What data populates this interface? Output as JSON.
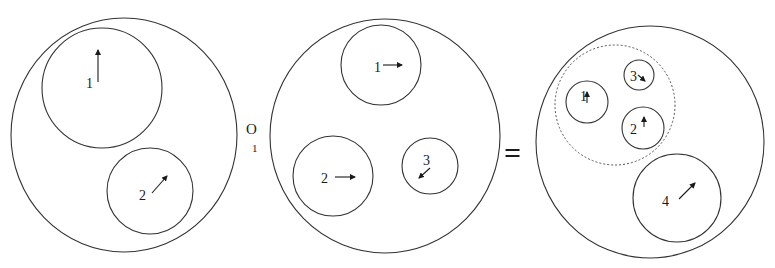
{
  "diagram": {
    "panels": [
      {
        "id": "left",
        "outer": {
          "cx": 124,
          "cy": 135,
          "rx": 113,
          "ry": 117
        },
        "bubbles": [
          {
            "label": "1",
            "cx": 102,
            "cy": 88,
            "r": 60,
            "lx": 86,
            "ly": 88,
            "arrow": [
              98,
              82,
              98,
              50
            ]
          },
          {
            "label": "2",
            "cx": 150,
            "cy": 191,
            "r": 43,
            "lx": 139,
            "ly": 200,
            "arrow": [
              152,
              193,
              167,
              176
            ]
          }
        ]
      },
      {
        "id": "middle",
        "outer": {
          "cx": 385,
          "cy": 136,
          "rx": 115,
          "ry": 117
        },
        "bubbles": [
          {
            "label": "1",
            "cx": 381,
            "cy": 65,
            "r": 40,
            "lx": 374,
            "ly": 72,
            "arrow": [
              383,
              65,
              402,
              65
            ]
          },
          {
            "label": "2",
            "cx": 333,
            "cy": 176,
            "r": 40,
            "lx": 321,
            "ly": 183,
            "arrow": [
              335,
              177,
              355,
              177
            ]
          },
          {
            "label": "3",
            "cx": 430,
            "cy": 166,
            "r": 28,
            "lx": 423,
            "ly": 165,
            "arrow": [
              430,
              168,
              419,
              178
            ]
          }
        ]
      },
      {
        "id": "right",
        "outer": {
          "cx": 650,
          "cy": 142,
          "rx": 114,
          "ry": 116
        },
        "group": {
          "cx": 615,
          "cy": 105,
          "r": 60,
          "style": "dotted"
        },
        "bubbles": [
          {
            "label": "1",
            "cx": 587,
            "cy": 102,
            "r": 21,
            "lx": 580,
            "ly": 101,
            "arrow": [
              587,
              103,
              587,
              92
            ]
          },
          {
            "label": "3",
            "cx": 639,
            "cy": 75,
            "r": 15,
            "lx": 630,
            "ly": 81,
            "arrow": [
              638,
              75,
              645,
              81
            ]
          },
          {
            "label": "2",
            "cx": 643,
            "cy": 128,
            "r": 21,
            "lx": 630,
            "ly": 134,
            "arrow": [
              644,
              127,
              644,
              117
            ]
          },
          {
            "label": "4",
            "cx": 677,
            "cy": 198,
            "r": 44,
            "lx": 662,
            "ly": 206,
            "arrow": [
              679,
              199,
              695,
              183
            ]
          }
        ]
      }
    ],
    "operator": {
      "main": "O",
      "subscript": "1"
    },
    "equals": "="
  }
}
